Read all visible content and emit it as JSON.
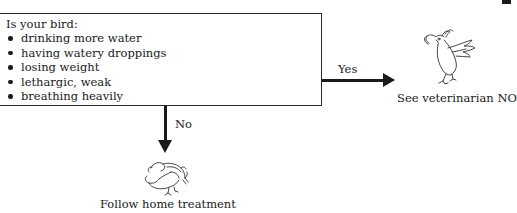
{
  "question_box": {
    "title": "Is your bird:",
    "symptoms": [
      "drinking more water",
      "having watery droppings",
      "losing weight",
      "lethargic, weak",
      "breathing heavily"
    ]
  },
  "branches": {
    "yes": {
      "label": "Yes",
      "outcome": "See veterinarian NOW",
      "icon": "alarmed-bird-icon"
    },
    "no": {
      "label": "No",
      "outcome": "Follow home treatment",
      "icon": "resting-bird-icon"
    }
  }
}
